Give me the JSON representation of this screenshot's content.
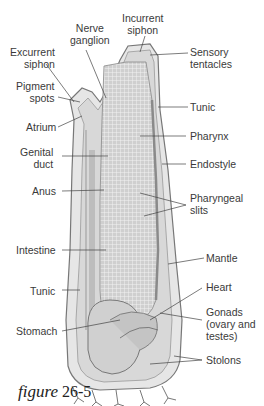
{
  "figure": {
    "caption_word": "figure",
    "caption_number": "26-5"
  },
  "labels": {
    "incurrent_siphon": "Incurrent\nsiphon",
    "nerve_ganglion": "Nerve\nganglion",
    "excurrent_siphon": "Excurrent\nsiphon",
    "sensory_tentacles": "Sensory\ntentacles",
    "pigment_spots": "Pigment\nspots",
    "tunic_top": "Tunic",
    "atrium": "Atrium",
    "pharynx": "Pharynx",
    "genital_duct": "Genital\nduct",
    "endostyle": "Endostyle",
    "anus": "Anus",
    "pharyngeal_slits": "Pharyngeal\nslits",
    "intestine": "Intestine",
    "mantle": "Mantle",
    "heart": "Heart",
    "tunic_bottom": "Tunic",
    "gonads": "Gonads\n(ovary and\ntestes)",
    "stomach": "Stomach",
    "stolons": "Stolons"
  },
  "colors": {
    "body_fill": "#d9d9d9",
    "tunic_stroke": "#7a7a7a",
    "pharynx_fill": "#c9c9c9",
    "leader_line": "#444444"
  }
}
